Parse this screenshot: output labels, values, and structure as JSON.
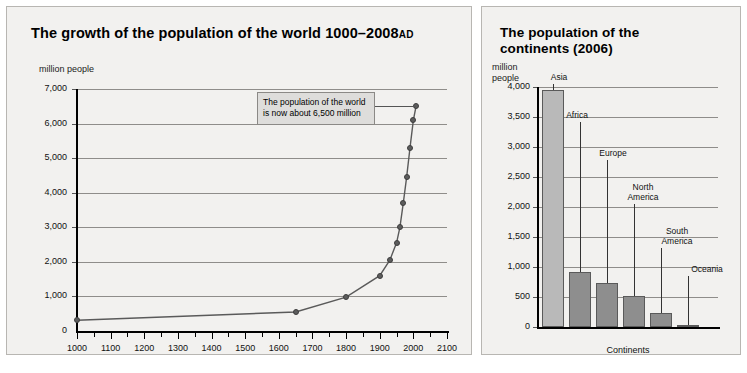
{
  "charts": {
    "left": {
      "title_main": "The growth of the population of the world 1000–2008",
      "title_suffix": "AD",
      "y_unit": "million people",
      "annotation": "The population of the world\nis now about 6,500 million"
    },
    "right": {
      "title": "The population of the\ncontinents (2006)",
      "y_unit": "million\npeople",
      "x_title": "Continents"
    }
  },
  "chart_data": [
    {
      "type": "line",
      "title": "The growth of the population of the world 1000-2008 AD",
      "xlabel": "",
      "ylabel": "million people",
      "xlim": [
        1000,
        2100
      ],
      "ylim": [
        0,
        7000
      ],
      "grid": true,
      "legend": "none",
      "xticks": [
        1000,
        1100,
        1200,
        1300,
        1400,
        1500,
        1600,
        1700,
        1800,
        1900,
        2000,
        2100
      ],
      "xtick_labels": [
        "1000",
        "1100",
        "1200",
        "1300",
        "1400",
        "1500",
        "1600",
        "1700",
        "1800",
        "1900",
        "2000",
        "2100"
      ],
      "yticks": [
        0,
        1000,
        2000,
        3000,
        4000,
        5000,
        6000,
        7000
      ],
      "ytick_labels": [
        "0",
        "1,000",
        "2,000",
        "3,000",
        "4,000",
        "5,000",
        "6,000",
        "7,000"
      ],
      "x": [
        1000,
        1650,
        1800,
        1900,
        1930,
        1950,
        1960,
        1970,
        1980,
        1990,
        2000,
        2008
      ],
      "y": [
        310,
        550,
        980,
        1600,
        2050,
        2550,
        3000,
        3700,
        4450,
        5300,
        6100,
        6500
      ],
      "annotations": [
        {
          "text": "The population of the world is now about 6,500 million",
          "points_to_x": 2008,
          "points_to_y": 6500
        }
      ]
    },
    {
      "type": "bar",
      "title": "The population of the continents (2006)",
      "xlabel": "Continents",
      "ylabel": "million people",
      "ylim": [
        0,
        4000
      ],
      "grid": true,
      "legend": "none",
      "yticks": [
        0,
        500,
        1000,
        1500,
        2000,
        2500,
        3000,
        3500,
        4000
      ],
      "ytick_labels": [
        "0",
        "500",
        "1,000",
        "1,500",
        "2,000",
        "2,500",
        "3,000",
        "3,500",
        "4,000"
      ],
      "categories": [
        "Asia",
        "Africa",
        "Europe",
        "North America",
        "South America",
        "Oceania"
      ],
      "values": [
        3950,
        920,
        730,
        515,
        230,
        35
      ]
    }
  ],
  "bar_labels": [
    {
      "label": "Asia"
    },
    {
      "label": "Africa"
    },
    {
      "label": "Europe"
    },
    {
      "label": "North\nAmerica"
    },
    {
      "label": "South\nAmerica"
    },
    {
      "label": "Oceania"
    }
  ]
}
